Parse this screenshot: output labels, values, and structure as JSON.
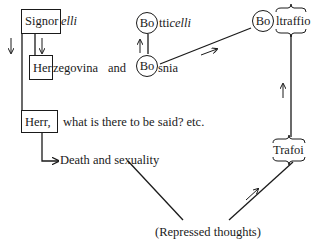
{
  "diagram": {
    "signorelli": {
      "boxed": "Signor",
      "rest": "elli"
    },
    "herzegovina": {
      "boxed": "Her",
      "rest": "zegovina",
      "connector": "and"
    },
    "bosnia": {
      "circled": "Bo",
      "rest": "snia"
    },
    "botticelli": {
      "circled": "Bo",
      "rest": "tti",
      "rest_italic": "celli"
    },
    "boltraffio": {
      "circled": "Bo",
      "rest": "ltraffio"
    },
    "herr": {
      "boxed": "Herr,",
      "rest": "what is there to be said? etc."
    },
    "death": {
      "label": "Death and sexuality"
    },
    "trafoi": {
      "label": "Trafoi"
    },
    "repressed": {
      "label": "(Repressed thoughts)"
    }
  }
}
